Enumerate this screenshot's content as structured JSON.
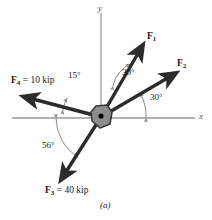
{
  "figure": {
    "caption": "(a)",
    "axes": {
      "x_label": "x",
      "y_label": "y",
      "axis_color": "#9a9a9a"
    },
    "origin": {
      "x": 101,
      "y": 117,
      "hub_color": "#8d8d8d",
      "hub_outline": "#3a3a3a",
      "pin_color": "#000000"
    },
    "vector_color": "#2b2b2b",
    "forces": [
      {
        "name": "F1",
        "label_main": "F",
        "label_sub": "1",
        "label_value": "",
        "tip": {
          "x": 142,
          "y": 48
        },
        "label_pos": {
          "x": 147,
          "y": 32
        }
      },
      {
        "name": "F2",
        "label_main": "F",
        "label_sub": "2",
        "label_value": "",
        "tip": {
          "x": 173,
          "y": 74
        },
        "label_pos": {
          "x": 177,
          "y": 59
        }
      },
      {
        "name": "F3",
        "label_main": "F",
        "label_sub": "3",
        "label_value": " = 40 kip",
        "tip": {
          "x": 62,
          "y": 178
        },
        "label_pos": {
          "x": 45,
          "y": 186
        }
      },
      {
        "name": "F4",
        "label_main": "F",
        "label_sub": "4",
        "label_value": " = 10 kip",
        "tip": {
          "x": 26,
          "y": 97
        },
        "label_pos": {
          "x": 11,
          "y": 76
        }
      }
    ],
    "angles": [
      {
        "name": "angle-f1-f2",
        "text": "30°",
        "pos": {
          "x": 122,
          "y": 68
        }
      },
      {
        "name": "angle-f2-x",
        "text": "30°",
        "pos": {
          "x": 150,
          "y": 93
        }
      },
      {
        "name": "angle-f4-x",
        "text": "15°",
        "pos": {
          "x": 68,
          "y": 71
        }
      },
      {
        "name": "angle-f3-x",
        "text": "56°",
        "pos": {
          "x": 42,
          "y": 141
        }
      }
    ]
  }
}
